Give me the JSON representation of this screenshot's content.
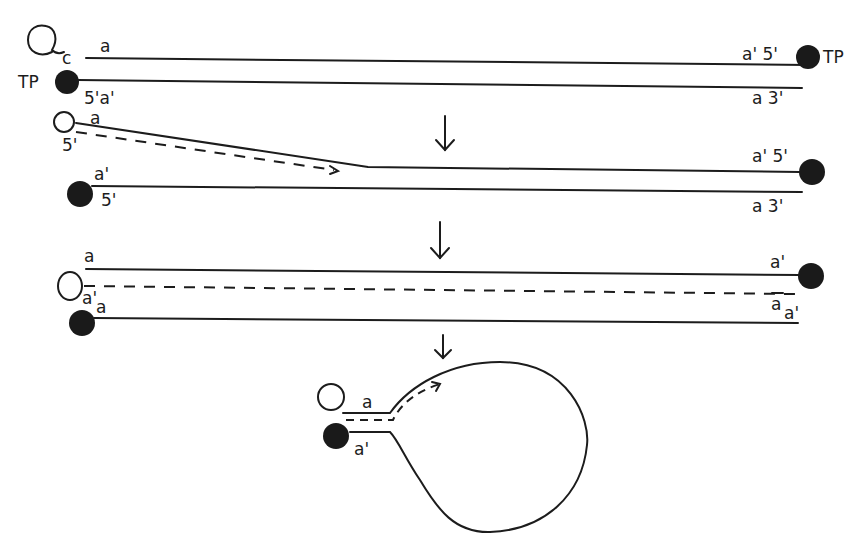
{
  "diagram": {
    "type": "dna-replication-schematic",
    "colors": {
      "ink": "#1c1c1c",
      "background": "#ffffff",
      "terminal_protein": "#1a1a1a"
    },
    "stage1": {
      "top_strand": {
        "label_left": "a",
        "label_right": "a' 5'",
        "loop_label": "c",
        "right_protein_label": "TP"
      },
      "bottom_strand": {
        "label_left": "5'a'",
        "label_right": "a  3'",
        "left_protein_label": "TP"
      }
    },
    "arrow1": {
      "glyph": "down-arrow"
    },
    "stage2": {
      "displaced_strand": {
        "label_left": "a",
        "label_left_end": "5'",
        "label_right": "a' 5'"
      },
      "bottom_strand": {
        "label_left": "a'",
        "label_left_end": "5'",
        "label_right": "a  3'"
      }
    },
    "arrow2": {
      "glyph": "down-arrow"
    },
    "stage3": {
      "top_strand": {
        "label_left": "a",
        "label_right": "a'"
      },
      "new_strand": {
        "label_left": "a'",
        "label_right": "a"
      },
      "bottom_strand": {
        "label_left": "a",
        "label_right": "a'"
      }
    },
    "arrow3": {
      "glyph": "down-arrow"
    },
    "stage4": {
      "panhandle": {
        "label_top": "a",
        "label_bottom": "a'"
      }
    }
  }
}
